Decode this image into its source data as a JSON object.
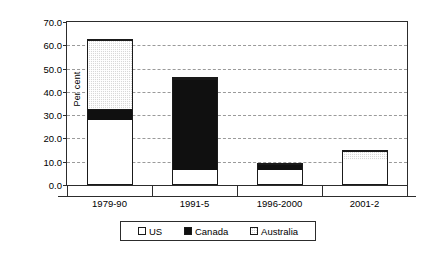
{
  "chart_data": {
    "type": "bar",
    "stacked": true,
    "title": "",
    "subtitle": "",
    "xlabel": "",
    "ylabel": "Per cent",
    "categories": [
      "1979-90",
      "1991-5",
      "1996-2000",
      "2001-2"
    ],
    "series": [
      {
        "name": "US",
        "values": [
          27.8,
          6.4,
          6.8,
          11.0
        ],
        "color": "#ffffff",
        "pattern": "solid-white"
      },
      {
        "name": "Canada",
        "values": [
          4.7,
          40.0,
          2.6,
          0.0
        ],
        "color": "#101010",
        "pattern": "solid-black"
      },
      {
        "name": "Australia",
        "values": [
          30.3,
          0.1,
          0.0,
          3.9
        ],
        "color": "#d8d8d8",
        "pattern": "stipple"
      }
    ],
    "totals": [
      62.8,
      46.5,
      9.4,
      14.9
    ],
    "ylim": [
      0.0,
      70.0
    ],
    "ytick_step": 10.0,
    "ytick_labels": [
      "0.0",
      "10.0",
      "20.0",
      "30.0",
      "40.0",
      "50.0",
      "60.0",
      "70.0"
    ],
    "ytick_values": [
      0.0,
      10.0,
      20.0,
      30.0,
      40.0,
      50.0,
      60.0,
      70.0
    ],
    "grid": true,
    "grid_style": "dashed-horizontal",
    "legend_position": "bottom",
    "legend_entries": [
      "US",
      "Canada",
      "Australia"
    ],
    "frame_color": "#2c2c2c",
    "background": "#ffffff"
  }
}
